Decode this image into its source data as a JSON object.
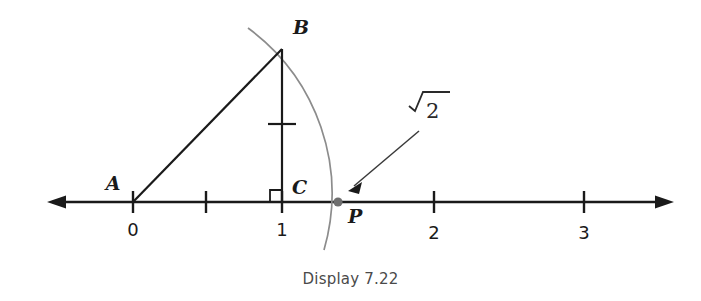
{
  "figure": {
    "caption": "Display 7.22",
    "number_line": {
      "axis_y": 202,
      "left_arrow_x": 48,
      "right_arrow_x": 673,
      "unit_px": 150.5,
      "origin_x": 133,
      "ticks": [
        {
          "value": "0",
          "x": 133,
          "label": "0",
          "major": true
        },
        {
          "value": "0.5",
          "x": 206,
          "label": "",
          "major": false
        },
        {
          "value": "1",
          "x": 282,
          "label": "1",
          "major": true
        },
        {
          "value": "2",
          "x": 434,
          "label": "2",
          "major": true
        },
        {
          "value": "3",
          "x": 584,
          "label": "3",
          "major": true
        }
      ]
    },
    "points": [
      {
        "name": "A",
        "label": "A",
        "x": 133,
        "y": 202,
        "label_x": 113,
        "label_y": 190,
        "dot": false
      },
      {
        "name": "B",
        "label": "B",
        "x": 282,
        "y": 50,
        "label_x": 291,
        "label_y": 34,
        "dot": false
      },
      {
        "name": "C",
        "label": "C",
        "x": 282,
        "y": 202,
        "label_x": 291,
        "label_y": 194,
        "dot": false
      },
      {
        "name": "P",
        "label": "P",
        "x": 338,
        "y": 202,
        "label_x": 348,
        "label_y": 222,
        "dot": true
      }
    ],
    "segments": [
      {
        "name": "hypotenuse-AB",
        "x1": 133,
        "y1": 202,
        "x2": 282,
        "y2": 50
      },
      {
        "name": "vertical-BC",
        "x1": 282,
        "y1": 50,
        "x2": 282,
        "y2": 202
      }
    ],
    "tick_mark_on_bc": {
      "x": 282,
      "y": 124,
      "half_width": 14
    },
    "right_angle_marker": {
      "x": 270,
      "y": 190,
      "size": 12
    },
    "arc": {
      "center_x": 133,
      "center_y": 202,
      "radius": 205,
      "start_x": 248,
      "start_y": 28,
      "end_x": 324,
      "end_y": 250
    },
    "annotation": {
      "label": "√2",
      "radical_symbol": "√",
      "radicand": "2",
      "label_x": 412,
      "label_y": 118,
      "arrow_from_x": 420,
      "arrow_from_y": 131,
      "arrow_to_x": 349,
      "arrow_to_y": 190
    },
    "colors": {
      "line": "#1a1a1a",
      "arc": "#8c8c8c",
      "text": "#1a1a1a",
      "caption": "#4a4a4a",
      "background": "#ffffff"
    }
  }
}
